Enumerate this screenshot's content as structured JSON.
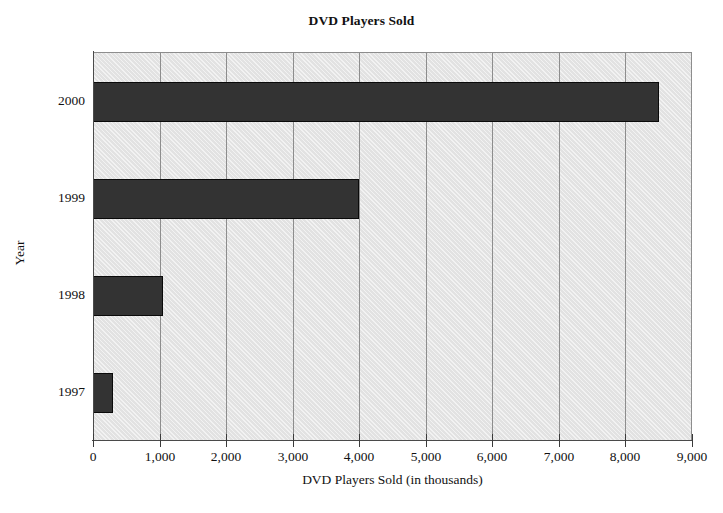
{
  "chart_data": {
    "type": "bar",
    "orientation": "horizontal",
    "title": "DVD Players Sold",
    "xlabel": "DVD Players Sold (in thousands)",
    "ylabel": "Year",
    "categories": [
      "2000",
      "1999",
      "1998",
      "1997"
    ],
    "values": [
      8500,
      4000,
      1050,
      300
    ],
    "xlim": [
      0,
      9000
    ],
    "xticks": [
      0,
      1000,
      2000,
      3000,
      4000,
      5000,
      6000,
      7000,
      8000,
      9000
    ],
    "xtick_labels": [
      "0",
      "1,000",
      "2,000",
      "3,000",
      "4,000",
      "5,000",
      "6,000",
      "7,000",
      "8,000",
      "9,000"
    ],
    "ytick_labels": [
      "2000",
      "1999",
      "1998",
      "1997"
    ],
    "grid": "vertical",
    "legend": null,
    "legend_position": "none",
    "colors": {
      "bar_fill": "#333333",
      "bar_edge": "#0a0a0a",
      "plot_background": "#e2e2e2",
      "gridline": "#8d8d8d",
      "axis_line": "#4a4a4a",
      "text": "#111111",
      "page_background": "#ffffff"
    },
    "series": [
      {
        "name": "DVD Players Sold",
        "points": [
          {
            "category": "2000",
            "value": 8500
          },
          {
            "category": "1999",
            "value": 4000
          },
          {
            "category": "1998",
            "value": 1050
          },
          {
            "category": "1997",
            "value": 300
          }
        ]
      }
    ]
  }
}
